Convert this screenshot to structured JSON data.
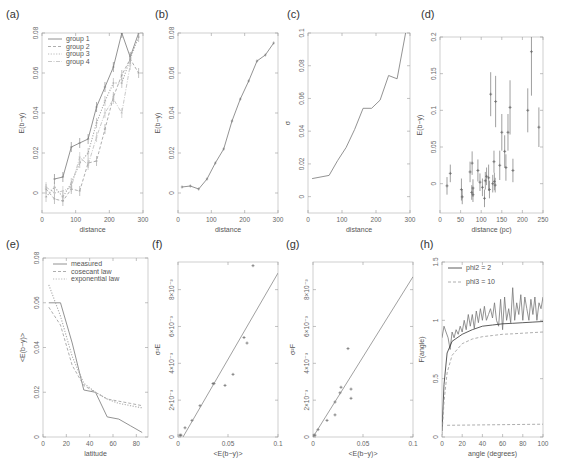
{
  "panels": {
    "a": {
      "label": "(a)",
      "xlabel": "distance",
      "ylabel": "E(b−y)"
    },
    "b": {
      "label": "(b)",
      "xlabel": "distance",
      "ylabel": "E(b−y)"
    },
    "c": {
      "label": "(c)",
      "xlabel": "distance",
      "ylabel": "σ"
    },
    "d": {
      "label": "(d)",
      "xlabel": "distance (pc)",
      "ylabel": "E(b−y)"
    },
    "e": {
      "label": "(e)",
      "xlabel": "latitude",
      "ylabel": "<E(b−y)>"
    },
    "f": {
      "label": "(f)",
      "xlabel": "<E(b−y)>",
      "ylabel": "σ²E"
    },
    "g": {
      "label": "(g)",
      "xlabel": "<E(b−y)>",
      "ylabel": "σ²F"
    },
    "h": {
      "label": "(h)",
      "xlabel": "angle (degrees)",
      "ylabel": "F(angle)"
    }
  },
  "chart_data": [
    {
      "id": "a",
      "type": "line",
      "title": "(a)",
      "xlabel": "distance",
      "ylabel": "E(b-y)",
      "xlim": [
        0,
        300
      ],
      "ylim": [
        -0.01,
        0.08
      ],
      "xticks": [
        "0",
        "100",
        "200",
        "300"
      ],
      "yticks": [
        "0",
        "0.02",
        "0.04",
        "0.06",
        "0.08"
      ],
      "legend": [
        "group 1",
        "group 2",
        "group 3",
        "group 4"
      ],
      "legend_position": "upper left",
      "x": [
        12,
        37,
        62,
        87,
        112,
        137,
        162,
        187,
        212,
        237,
        262,
        287
      ],
      "series": [
        {
          "name": "group 1",
          "style": "solid",
          "values": [
            null,
            0.007,
            0.008,
            0.023,
            0.025,
            0.027,
            0.043,
            0.053,
            0.063,
            0.08,
            0.068,
            0.08
          ]
        },
        {
          "name": "group 2",
          "style": "dashed",
          "values": [
            0.002,
            -0.003,
            -0.004,
            0.002,
            0.001,
            0.015,
            0.016,
            0.032,
            0.048,
            0.059,
            0.067,
            0.06
          ]
        },
        {
          "name": "group 3",
          "style": "dotted",
          "values": [
            -0.002,
            0.003,
            -0.002,
            0.005,
            0.015,
            0.02,
            0.035,
            0.046,
            0.055,
            0.055,
            0.067,
            0.078
          ]
        },
        {
          "name": "group 4",
          "style": "dash-dot",
          "values": [
            0.003,
            0.0,
            0.001,
            0.003,
            0.018,
            0.014,
            0.028,
            0.04,
            0.047,
            0.04,
            0.064,
            null
          ]
        }
      ]
    },
    {
      "id": "b",
      "type": "line",
      "title": "(b)",
      "xlabel": "distance",
      "ylabel": "E(b-y)",
      "xlim": [
        0,
        300
      ],
      "ylim": [
        -0.01,
        0.08
      ],
      "xticks": [
        "0",
        "100",
        "200",
        "300"
      ],
      "yticks": [
        "0",
        "0.02",
        "0.04",
        "0.06",
        "0.08"
      ],
      "x": [
        12,
        37,
        62,
        87,
        112,
        137,
        162,
        187,
        212,
        237,
        262,
        287
      ],
      "series": [
        {
          "name": "mean",
          "values": [
            0.003,
            0.0035,
            0.002,
            0.007,
            0.015,
            0.022,
            0.036,
            0.047,
            0.056,
            0.066,
            0.069,
            0.075
          ]
        }
      ]
    },
    {
      "id": "c",
      "type": "line",
      "title": "(c)",
      "xlabel": "distance",
      "ylabel": "sigma",
      "xlim": [
        0,
        300
      ],
      "ylim": [
        -0.01,
        0.1
      ],
      "xticks": [
        "0",
        "100",
        "200",
        "300"
      ],
      "yticks": [
        "0",
        "0.02",
        "0.04",
        "0.06",
        "0.08",
        "0.1"
      ],
      "x": [
        12,
        62,
        87,
        112,
        137,
        162,
        187,
        212,
        237,
        262,
        287
      ],
      "series": [
        {
          "name": "sigma",
          "values": [
            0.011,
            0.013,
            0.022,
            0.03,
            0.041,
            0.054,
            0.054,
            0.059,
            0.074,
            0.072,
            0.1
          ]
        }
      ]
    },
    {
      "id": "d",
      "type": "scatter",
      "title": "(d)",
      "xlabel": "distance (pc)",
      "ylabel": "E(b-y)",
      "xlim": [
        0,
        250
      ],
      "ylim": [
        -0.04,
        0.2
      ],
      "xticks": [
        "0",
        "50",
        "100",
        "150",
        "200",
        "250"
      ],
      "yticks": [
        "0",
        "0.05",
        "0.1",
        "0.15",
        "0.2"
      ],
      "points": [
        {
          "x": 17,
          "y": -0.003,
          "err": 0.012
        },
        {
          "x": 25,
          "y": 0.014,
          "err": 0.012
        },
        {
          "x": 52,
          "y": -0.008,
          "err": 0.015
        },
        {
          "x": 54,
          "y": -0.018,
          "err": 0.01
        },
        {
          "x": 73,
          "y": 0.016,
          "err": 0.014
        },
        {
          "x": 77,
          "y": -0.012,
          "err": 0.01
        },
        {
          "x": 78,
          "y": 0.028,
          "err": 0.016
        },
        {
          "x": 80,
          "y": -0.006,
          "err": 0.012
        },
        {
          "x": 80,
          "y": -0.015,
          "err": 0.01
        },
        {
          "x": 92,
          "y": 0.018,
          "err": 0.015
        },
        {
          "x": 97,
          "y": 0.002,
          "err": 0.012
        },
        {
          "x": 103,
          "y": -0.005,
          "err": 0.012
        },
        {
          "x": 108,
          "y": -0.02,
          "err": 0.012
        },
        {
          "x": 110,
          "y": 0.004,
          "err": 0.012
        },
        {
          "x": 113,
          "y": 0.01,
          "err": 0.012
        },
        {
          "x": 118,
          "y": 0.008,
          "err": 0.018
        },
        {
          "x": 120,
          "y": -0.008,
          "err": 0.012
        },
        {
          "x": 123,
          "y": 0.122,
          "err": 0.03
        },
        {
          "x": 128,
          "y": 0.0,
          "err": 0.012
        },
        {
          "x": 131,
          "y": 0.03,
          "err": 0.015
        },
        {
          "x": 132,
          "y": 0.003,
          "err": 0.012
        },
        {
          "x": 134,
          "y": -0.002,
          "err": 0.01
        },
        {
          "x": 135,
          "y": 0.112,
          "err": 0.035
        },
        {
          "x": 145,
          "y": 0.025,
          "err": 0.02
        },
        {
          "x": 150,
          "y": 0.07,
          "err": 0.025
        },
        {
          "x": 157,
          "y": 0.044,
          "err": 0.022
        },
        {
          "x": 160,
          "y": 0.022,
          "err": 0.018
        },
        {
          "x": 165,
          "y": 0.07,
          "err": 0.025
        },
        {
          "x": 170,
          "y": 0.104,
          "err": 0.037
        },
        {
          "x": 177,
          "y": 0.018,
          "err": 0.016
        },
        {
          "x": 213,
          "y": 0.1,
          "err": 0.03
        },
        {
          "x": 222,
          "y": 0.18,
          "err": 0.06
        },
        {
          "x": 240,
          "y": 0.077,
          "err": 0.027
        }
      ]
    },
    {
      "id": "e",
      "type": "line",
      "title": "(e)",
      "xlabel": "latitude",
      "ylabel": "<E(b-y)>",
      "xlim": [
        0,
        90
      ],
      "ylim": [
        0,
        0.08
      ],
      "xticks": [
        "0",
        "20",
        "40",
        "60",
        "80"
      ],
      "yticks": [
        "0",
        "0.02",
        "0.04",
        "0.06",
        "0.08"
      ],
      "legend": [
        "measured",
        "cosecant law",
        "exponential law"
      ],
      "legend_position": "upper right",
      "x": [
        5,
        15,
        25,
        35,
        45,
        55,
        65,
        75,
        85
      ],
      "series": [
        {
          "name": "measured",
          "style": "solid",
          "values": [
            0.06,
            0.06,
            0.042,
            0.021,
            0.02,
            0.009,
            0.008,
            0.005,
            0.002
          ]
        },
        {
          "name": "cosecant law",
          "style": "dashed",
          "values": [
            0.058,
            0.05,
            0.032,
            0.023,
            0.02,
            0.017,
            0.016,
            0.015,
            0.014
          ]
        },
        {
          "name": "exponential law",
          "style": "dotted",
          "values": [
            0.068,
            0.054,
            0.036,
            0.024,
            0.02,
            0.017,
            0.015,
            0.014,
            0.013
          ]
        }
      ]
    },
    {
      "id": "f",
      "type": "scatter",
      "title": "(f)",
      "xlabel": "<E(b-y)>",
      "ylabel": "sigma^2 E",
      "xlim": [
        0,
        0.1
      ],
      "ylim": [
        0,
        0.0095
      ],
      "xticks": [
        "0",
        "0.05",
        "0.1"
      ],
      "yticks": [
        "0",
        "2×10⁻³",
        "4×10⁻³",
        "6×10⁻³",
        "8×10⁻³"
      ],
      "points": [
        {
          "x": 0.002,
          "y": 0.0001
        },
        {
          "x": 0.003,
          "y": 0.0001
        },
        {
          "x": 0.007,
          "y": 0.0005
        },
        {
          "x": 0.014,
          "y": 0.0009
        },
        {
          "x": 0.022,
          "y": 0.0017
        },
        {
          "x": 0.035,
          "y": 0.0029
        },
        {
          "x": 0.036,
          "y": 0.0029
        },
        {
          "x": 0.047,
          "y": 0.0028
        },
        {
          "x": 0.055,
          "y": 0.0034
        },
        {
          "x": 0.066,
          "y": 0.0054
        },
        {
          "x": 0.069,
          "y": 0.0051
        },
        {
          "x": 0.075,
          "y": 0.0093
        }
      ],
      "fit_line": {
        "x": [
          0.005,
          0.1
        ],
        "y": [
          0.0,
          0.0089
        ]
      }
    },
    {
      "id": "g",
      "type": "scatter",
      "title": "(g)",
      "xlabel": "<E(b-y)>",
      "ylabel": "sigma^2 F",
      "xlim": [
        0,
        0.1
      ],
      "ylim": [
        0,
        0.0095
      ],
      "xticks": [
        "0",
        "0.05",
        "0.1"
      ],
      "yticks": [
        "0",
        "2×10⁻³",
        "4×10⁻³",
        "6×10⁻³",
        "8×10⁻³"
      ],
      "points": [
        {
          "x": 0.001,
          "y": 0.0001
        },
        {
          "x": 0.002,
          "y": 0.0001
        },
        {
          "x": 0.005,
          "y": 0.0004
        },
        {
          "x": 0.014,
          "y": 0.0009
        },
        {
          "x": 0.022,
          "y": 0.0012
        },
        {
          "x": 0.022,
          "y": 0.0019
        },
        {
          "x": 0.027,
          "y": 0.0024
        },
        {
          "x": 0.028,
          "y": 0.0027
        },
        {
          "x": 0.035,
          "y": 0.0048
        },
        {
          "x": 0.038,
          "y": 0.0021
        },
        {
          "x": 0.038,
          "y": 0.0026
        }
      ],
      "fit_line": {
        "x": [
          0.0,
          0.1
        ],
        "y": [
          0.0,
          0.0087
        ]
      }
    },
    {
      "id": "h",
      "type": "line",
      "title": "(h)",
      "xlabel": "angle (degrees)",
      "ylabel": "F(angle)",
      "xlim": [
        0,
        100
      ],
      "ylim": [
        0,
        1.5
      ],
      "xticks": [
        "0",
        "20",
        "40",
        "60",
        "80",
        "100"
      ],
      "yticks": [
        "0",
        "0.5",
        "1",
        "1.5"
      ],
      "legend": [
        "phi2 = 2",
        "phi3 = 10"
      ],
      "legend_position": "upper left",
      "series": [
        {
          "name": "measured (noisy)",
          "style": "solid",
          "x": [
            0,
            2,
            4,
            6,
            8,
            10,
            12,
            14,
            16,
            18,
            20,
            22,
            24,
            26,
            28,
            30,
            32,
            34,
            36,
            38,
            40,
            42,
            44,
            46,
            48,
            50,
            52,
            54,
            56,
            58,
            60,
            62,
            64,
            66,
            68,
            70,
            72,
            74,
            76,
            78,
            80,
            82,
            84,
            86,
            88,
            90,
            92,
            94,
            96,
            98,
            100
          ],
          "values": [
            0.85,
            0.95,
            0.9,
            0.85,
            0.75,
            0.9,
            0.85,
            0.92,
            0.88,
            0.95,
            0.9,
            1.0,
            0.92,
            1.05,
            0.95,
            1.05,
            0.93,
            1.08,
            0.98,
            1.1,
            1.0,
            1.12,
            1.0,
            1.05,
            1.1,
            1.02,
            1.15,
            1.0,
            0.95,
            1.18,
            0.92,
            1.2,
            1.0,
            1.1,
            0.98,
            1.28,
            1.0,
            1.15,
            1.05,
            1.22,
            1.0,
            1.2,
            1.1,
            1.0,
            1.18,
            1.05,
            1.2,
            1.0,
            1.15,
            1.1,
            1.2
          ]
        },
        {
          "name": "phi2 = 2",
          "style": "solid-dark",
          "x": [
            0,
            2,
            5,
            10,
            20,
            30,
            40,
            50,
            60,
            70,
            80,
            90,
            100
          ],
          "values": [
            0.05,
            0.45,
            0.72,
            0.82,
            0.88,
            0.92,
            0.95,
            0.96,
            0.97,
            0.975,
            0.98,
            0.985,
            0.99
          ]
        },
        {
          "name": "phi3 = 10",
          "style": "dashed",
          "x": [
            0,
            2,
            5,
            10,
            20,
            30,
            40,
            50,
            60,
            70,
            80,
            90,
            100
          ],
          "values": [
            0.02,
            0.3,
            0.55,
            0.7,
            0.8,
            0.84,
            0.86,
            0.87,
            0.88,
            0.885,
            0.89,
            0.895,
            0.9
          ]
        },
        {
          "name": "baseline",
          "style": "dashed",
          "x": [
            5,
            100
          ],
          "values": [
            0.1,
            0.11
          ]
        }
      ]
    }
  ]
}
